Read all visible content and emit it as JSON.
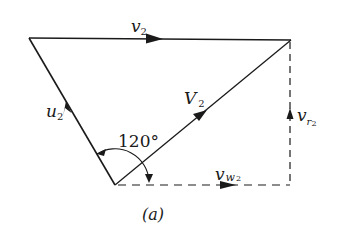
{
  "figure": {
    "caption": "(a)",
    "angle_label": "120°",
    "colors": {
      "line": "#1a1a1a",
      "background": "#ffffff"
    }
  },
  "vectors": {
    "v2": {
      "symbol": "v",
      "subscript": "2",
      "style": "solid"
    },
    "u2": {
      "symbol": "u",
      "subscript": "2",
      "style": "solid"
    },
    "V2": {
      "symbol": "V",
      "subscript": "2",
      "style": "solid"
    },
    "vr2": {
      "symbol": "v",
      "subscript": "r",
      "subsubscript": "2",
      "style": "dashed"
    },
    "vw2": {
      "symbol": "v",
      "subscript": "w",
      "subsubscript": "2",
      "style": "dashed"
    }
  }
}
